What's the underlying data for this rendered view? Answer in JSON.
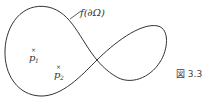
{
  "figure": {
    "curve_label": "f(∂Ω)",
    "points": [
      {
        "name": "p",
        "subscript": "1",
        "marker": "×"
      },
      {
        "name": "p",
        "subscript": "2",
        "marker": "×"
      }
    ],
    "caption": "図 3.3",
    "colors": {
      "stroke": "#333333",
      "text": "#333333",
      "background": "#ffffff"
    }
  }
}
